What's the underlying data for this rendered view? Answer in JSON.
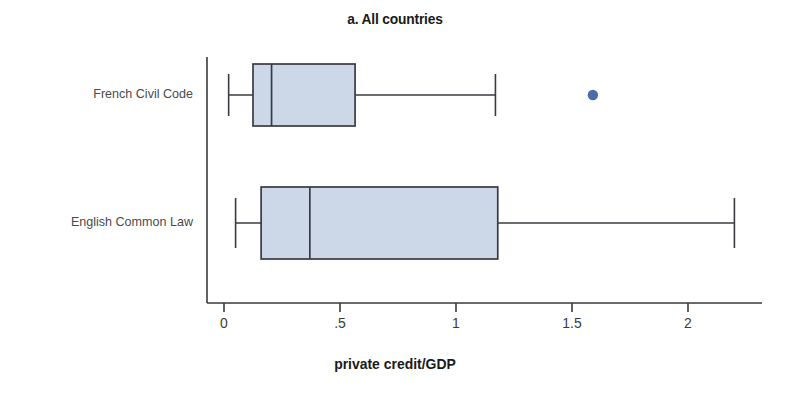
{
  "chart_data": {
    "type": "boxplot",
    "title": "a. All countries",
    "xlabel": "private credit/GDP",
    "ylabel": "",
    "xlim": [
      0,
      2.26
    ],
    "xticks": [
      0,
      0.5,
      1,
      1.5,
      2
    ],
    "xticklabels": [
      "0",
      ".5",
      "1",
      "1.5",
      "2"
    ],
    "grid": false,
    "legend": null,
    "orientation": "horizontal",
    "categories": [
      "French Civil Code",
      "English Common Law"
    ],
    "boxes": [
      {
        "category": "French Civil Code",
        "whisker_low": 0.02,
        "q1": 0.125,
        "median": 0.205,
        "q3": 0.565,
        "whisker_high": 1.17,
        "outliers": [
          1.59
        ]
      },
      {
        "category": "English Common Law",
        "whisker_low": 0.05,
        "q1": 0.16,
        "median": 0.37,
        "q3": 1.18,
        "whisker_high": 2.2,
        "outliers": []
      }
    ],
    "colors": {
      "box_fill": "#ccd7e8",
      "box_edge": "#3a3a42",
      "whisker": "#3a3a42",
      "outlier": "#4a6cab",
      "axis": "#3a3a3a",
      "title_text": "#1a1a1a",
      "category_text": "#4a4a4a"
    }
  }
}
